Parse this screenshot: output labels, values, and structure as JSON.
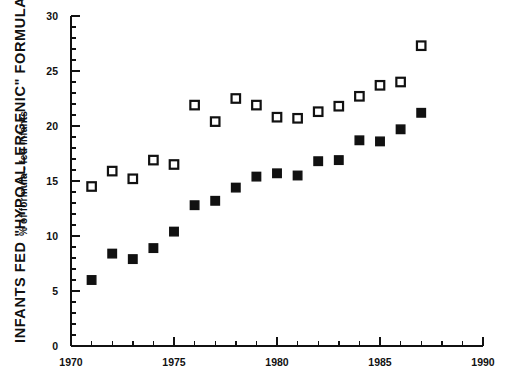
{
  "chart_data": {
    "type": "scatter",
    "title": "INFANTS FED \"HYPOALLERGENIC\" FORMULAS",
    "subtitle": "% of formula - fed infants",
    "xlabel": "",
    "ylabel": "% of formula - fed infants",
    "xlim": [
      1970,
      1990
    ],
    "ylim": [
      0,
      30
    ],
    "xticks": [
      1970,
      1975,
      1980,
      1985,
      1990
    ],
    "xtick_labels": [
      "1970",
      "1975",
      "1980",
      "1985",
      "1990"
    ],
    "x_minor_tick_interval": 1,
    "yticks": [
      0,
      5,
      10,
      15,
      20,
      25,
      30
    ],
    "ytick_labels": [
      "0",
      "5",
      "10",
      "15",
      "20",
      "25",
      "30"
    ],
    "y_minor_tick_interval": 1,
    "grid": false,
    "legend": "none",
    "x": [
      1971,
      1972,
      1973,
      1974,
      1975,
      1976,
      1977,
      1978,
      1979,
      1980,
      1981,
      1982,
      1983,
      1984,
      1985,
      1986,
      1987
    ],
    "series": [
      {
        "name": "open-square-series",
        "marker": "open-square",
        "color": "#111111",
        "fill": "#ffffff",
        "values": [
          14.5,
          15.9,
          15.2,
          16.9,
          16.5,
          21.9,
          20.4,
          22.5,
          21.9,
          20.8,
          20.7,
          21.3,
          21.8,
          22.7,
          23.7,
          24.0,
          27.3
        ]
      },
      {
        "name": "filled-square-series",
        "marker": "filled-square",
        "color": "#111111",
        "fill": "#111111",
        "values": [
          6.0,
          8.4,
          7.9,
          8.9,
          10.4,
          12.8,
          13.2,
          14.4,
          15.4,
          15.7,
          15.5,
          16.8,
          16.9,
          18.7,
          18.6,
          19.7,
          21.2
        ]
      }
    ]
  }
}
